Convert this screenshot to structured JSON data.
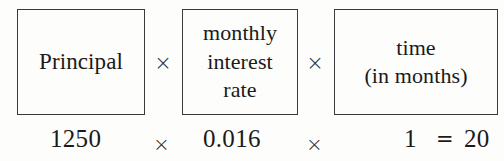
{
  "formula": {
    "description": "Simple interest formula diagram: Principal times monthly interest rate times time in months equals interest",
    "boxes": [
      {
        "name": "principal",
        "label": "Principal"
      },
      {
        "name": "monthly-interest-rate",
        "label": "monthly\ninterest\nrate"
      },
      {
        "name": "time-in-months",
        "label": "time\n(in months)"
      }
    ],
    "operators": {
      "times": "×",
      "equals": "="
    },
    "values": {
      "principal": "1250",
      "rate": "0.016",
      "time": "1",
      "result": "20"
    },
    "colors": {
      "background": "#fdfdfc",
      "text": "#1a1a1a",
      "border": "#3a3a3a"
    }
  }
}
